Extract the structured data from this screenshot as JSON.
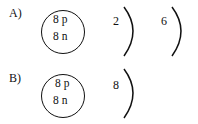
{
  "options": [
    {
      "label": "A)",
      "nucleus": {
        "protons": "8 p",
        "neutrons": "8 n"
      },
      "shells": [
        "2",
        "6"
      ]
    },
    {
      "label": "B)",
      "nucleus": {
        "protons": "8 p",
        "neutrons": "8 n"
      },
      "shells": [
        "8"
      ]
    }
  ]
}
